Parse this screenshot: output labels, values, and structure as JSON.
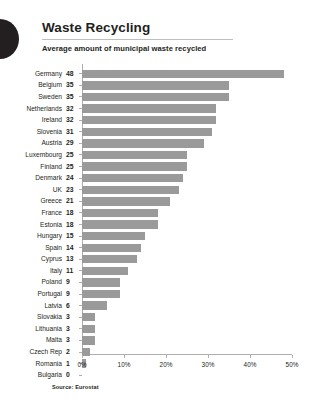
{
  "header": {
    "logo_icon": "half-circle-logo-icon",
    "title": "Waste Recycling",
    "subtitle": "Average amount of municipal waste recycled"
  },
  "footer": {
    "source": "Source: Eurostat"
  },
  "colors": {
    "bar": "#9a9a9a",
    "text": "#231f20",
    "axis": "#b0b0b0",
    "rule": "#bfbfbf",
    "background": "#ffffff",
    "logo": "#231f20"
  },
  "chart_data": {
    "type": "bar",
    "orientation": "horizontal",
    "title": "Waste Recycling",
    "subtitle": "Average amount of municipal waste recycled",
    "xlabel": "",
    "ylabel": "",
    "xlim": [
      0,
      50
    ],
    "xticks": [
      0,
      10,
      20,
      30,
      40,
      50
    ],
    "xticklabels": [
      "0%",
      "10%",
      "20%",
      "30%",
      "40%",
      "50%"
    ],
    "grid": false,
    "legend": false,
    "value_suffix": "%",
    "categories": [
      "Germany",
      "Belgium",
      "Sweden",
      "Netherlands",
      "Ireland",
      "Slovenia",
      "Austria",
      "Luxembourg",
      "Finland",
      "Denmark",
      "UK",
      "Greece",
      "France",
      "Estonia",
      "Hungary",
      "Spain",
      "Cyprus",
      "Italy",
      "Poland",
      "Portugal",
      "Latvia",
      "Slovakia",
      "Lithuania",
      "Malta",
      "Czech Rep",
      "Romania",
      "Bulgaria"
    ],
    "values": [
      48,
      35,
      35,
      32,
      32,
      31,
      29,
      25,
      25,
      24,
      23,
      21,
      18,
      18,
      15,
      14,
      13,
      11,
      9,
      9,
      6,
      3,
      3,
      3,
      2,
      1,
      0
    ],
    "rows": [
      {
        "label": "Germany",
        "value": 48
      },
      {
        "label": "Belgium",
        "value": 35
      },
      {
        "label": "Sweden",
        "value": 35
      },
      {
        "label": "Netherlands",
        "value": 32
      },
      {
        "label": "Ireland",
        "value": 32
      },
      {
        "label": "Slovenia",
        "value": 31
      },
      {
        "label": "Austria",
        "value": 29
      },
      {
        "label": "Luxembourg",
        "value": 25
      },
      {
        "label": "Finland",
        "value": 25
      },
      {
        "label": "Denmark",
        "value": 24
      },
      {
        "label": "UK",
        "value": 23
      },
      {
        "label": "Greece",
        "value": 21
      },
      {
        "label": "France",
        "value": 18
      },
      {
        "label": "Estonia",
        "value": 18
      },
      {
        "label": "Hungary",
        "value": 15
      },
      {
        "label": "Spain",
        "value": 14
      },
      {
        "label": "Cyprus",
        "value": 13
      },
      {
        "label": "Italy",
        "value": 11
      },
      {
        "label": "Poland",
        "value": 9
      },
      {
        "label": "Portugal",
        "value": 9
      },
      {
        "label": "Latvia",
        "value": 6
      },
      {
        "label": "Slovakia",
        "value": 3
      },
      {
        "label": "Lithuania",
        "value": 3
      },
      {
        "label": "Malta",
        "value": 3
      },
      {
        "label": "Czech Rep",
        "value": 2
      },
      {
        "label": "Romania",
        "value": 1
      },
      {
        "label": "Bulgaria",
        "value": 0
      }
    ]
  }
}
